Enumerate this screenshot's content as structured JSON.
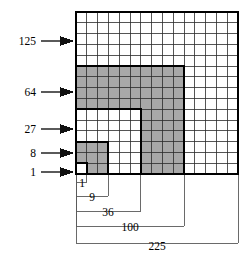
{
  "figure": {
    "grid": {
      "side_cells": 15,
      "cell_px": 10.8,
      "origin_x": 76,
      "origin_y": 12,
      "fill_shaded": "#a8a8a8",
      "fill_plain": "#ffffff",
      "line_thin": "#2b2b2b",
      "line_thick": "#000000",
      "leader_color": "#5a5a5a"
    },
    "cube_labels": [
      {
        "text": "125",
        "row_span": [
          0,
          5
        ],
        "shaded": false,
        "y": 41,
        "arrow_y": 41
      },
      {
        "text": "64",
        "row_span": [
          5,
          9
        ],
        "shaded": true,
        "y": 92,
        "arrow_y": 92
      },
      {
        "text": "27",
        "row_span": [
          9,
          12
        ],
        "shaded": false,
        "y": 129,
        "arrow_y": 129
      },
      {
        "text": "8",
        "row_span": [
          12,
          14
        ],
        "shaded": true,
        "y": 153,
        "arrow_y": 153
      },
      {
        "text": "1",
        "row_span": [
          14,
          15
        ],
        "shaded": false,
        "y": 172,
        "arrow_y": 172
      }
    ],
    "square_labels": [
      {
        "text": "1",
        "cells": 1,
        "bracket_y": 182,
        "label_x": 82,
        "label_y": 187
      },
      {
        "text": "9",
        "cells": 3,
        "bracket_y": 196,
        "label_x": 92,
        "label_y": 201
      },
      {
        "text": "36",
        "cells": 6,
        "bracket_y": 211,
        "label_x": 108,
        "label_y": 216
      },
      {
        "text": "100",
        "cells": 10,
        "bracket_y": 226,
        "label_x": 130,
        "label_y": 231
      },
      {
        "text": "225",
        "cells": 15,
        "bracket_y": 243,
        "label_x": 157,
        "label_y": 250
      }
    ],
    "gnomon_rings": [
      {
        "value": 1,
        "inner": 0,
        "outer": 1,
        "shaded": false
      },
      {
        "value": 8,
        "inner": 1,
        "outer": 3,
        "shaded": true
      },
      {
        "value": 27,
        "inner": 3,
        "outer": 6,
        "shaded": false
      },
      {
        "value": 64,
        "inner": 6,
        "outer": 10,
        "shaded": true
      },
      {
        "value": 125,
        "inner": 10,
        "outer": 15,
        "shaded": false
      }
    ]
  }
}
